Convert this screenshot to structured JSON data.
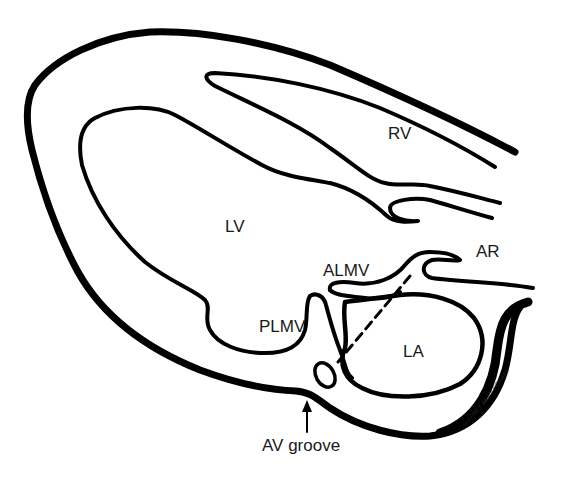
{
  "diagram": {
    "type": "anatomical-line-drawing",
    "stroke_color": "#000000",
    "background_color": "#ffffff",
    "labels": {
      "rv": "RV",
      "lv": "LV",
      "ar": "AR",
      "almv": "ALMV",
      "plmv": "PLMV",
      "la": "LA",
      "av_groove": "AV groove"
    },
    "signature": "JEFFREY ALAN SCHAEF"
  }
}
